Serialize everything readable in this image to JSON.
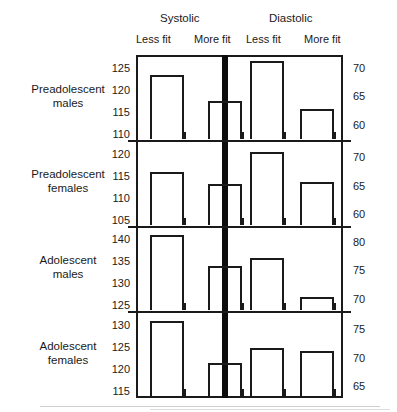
{
  "header": {
    "groups": [
      {
        "label": "Systolic"
      },
      {
        "label": "Diastolic"
      }
    ],
    "subheaders": [
      {
        "label": "Less fit"
      },
      {
        "label": "More fit"
      },
      {
        "label": "Less fit"
      },
      {
        "label": "More fit"
      }
    ]
  },
  "chart_data": {
    "type": "bar",
    "title": "",
    "xlabel": "",
    "ylabel": "",
    "grid": false,
    "legend_position": "top",
    "series": [
      {
        "name": "Systolic – Less fit"
      },
      {
        "name": "Systolic – More fit"
      },
      {
        "name": "Diastolic – Less fit"
      },
      {
        "name": "Diastolic – More fit"
      }
    ],
    "panels": [
      {
        "category": "Preadolescent males",
        "category_line1": "Preadolescent",
        "category_line2": "males",
        "systolic": {
          "ylim": [
            108,
            127
          ],
          "ticks": [
            125,
            120,
            115,
            110
          ],
          "values": {
            "less_fit": 122.5,
            "more_fit": 116.5
          }
        },
        "diastolic": {
          "ylim": [
            56.8,
            71.6
          ],
          "ticks": [
            70,
            65,
            60
          ],
          "values": {
            "less_fit": 70.5,
            "more_fit": 62.0
          }
        }
      },
      {
        "category": "Preadolescent females",
        "category_line1": "Preadolescent",
        "category_line2": "females",
        "systolic": {
          "ylim": [
            103,
            122
          ],
          "ticks": [
            120,
            115,
            110,
            105
          ],
          "values": {
            "less_fit": 115.0,
            "more_fit": 112.3
          }
        },
        "diastolic": {
          "ylim": [
            57.5,
            72.2
          ],
          "ticks": [
            70,
            65,
            60
          ],
          "values": {
            "less_fit": 70.2,
            "more_fit": 65.0
          }
        }
      },
      {
        "category": "Adolescent males",
        "category_line1": "Adolescent",
        "category_line2": "males",
        "systolic": {
          "ylim": [
            123,
            142
          ],
          "ticks": [
            140,
            135,
            130,
            125
          ],
          "values": {
            "less_fit": 140.0,
            "more_fit": 133.0
          }
        },
        "diastolic": {
          "ylim": [
            67.3,
            82.0
          ],
          "ticks": [
            80,
            75,
            70
          ],
          "values": {
            "less_fit": 76.5,
            "more_fit": 69.6
          }
        }
      },
      {
        "category": "Adolescent females",
        "category_line1": "Adolescent",
        "category_line2": "females",
        "systolic": {
          "ylim": [
            113,
            132
          ],
          "ticks": [
            130,
            125,
            120,
            115
          ],
          "values": {
            "less_fit": 130.0,
            "more_fit": 120.5
          }
        },
        "diastolic": {
          "ylim": [
            62.6,
            77.3
          ],
          "ticks": [
            75,
            70,
            65
          ],
          "values": {
            "less_fit": 71.0,
            "more_fit": 70.5
          }
        }
      }
    ]
  }
}
